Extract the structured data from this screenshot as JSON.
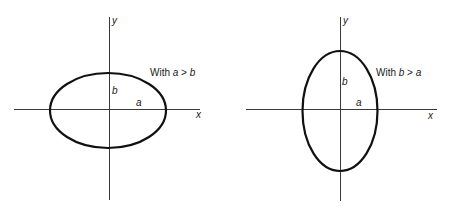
{
  "figures": [
    {
      "id": "left",
      "caption_prefix": "With ",
      "caption_var1": "a",
      "caption_op": " > ",
      "caption_var2": "b",
      "axis_x_label": "x",
      "axis_y_label": "y",
      "semi_axis_a_label": "a",
      "semi_axis_b_label": "b",
      "ellipse": {
        "cx": 108,
        "cy": 110.5,
        "rx": 58,
        "ry": 37.5
      }
    },
    {
      "id": "right",
      "caption_prefix": "With ",
      "caption_var1": "b",
      "caption_op": " > ",
      "caption_var2": "a",
      "axis_x_label": "x",
      "axis_y_label": "y",
      "semi_axis_a_label": "a",
      "semi_axis_b_label": "b",
      "ellipse": {
        "cx": 340,
        "cy": 111,
        "rx": 37.5,
        "ry": 60
      }
    }
  ]
}
